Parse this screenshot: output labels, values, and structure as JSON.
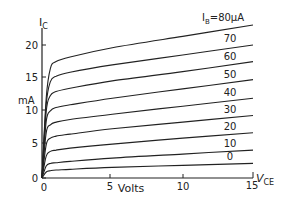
{
  "chart_data": {
    "type": "line",
    "title": "",
    "xlabel": "Volts",
    "xaxis_symbol": "V",
    "xaxis_symbol_sub": "CE",
    "ylabel": "mA",
    "yaxis_symbol": "I",
    "yaxis_symbol_sub": "C",
    "xlim": [
      0,
      15
    ],
    "ylim": [
      0,
      23
    ],
    "x_ticks": [
      "0",
      "5",
      "10",
      "15"
    ],
    "y_ticks": [
      "0",
      "5",
      "10",
      "15",
      "20"
    ],
    "grid": false,
    "legend_position": "inline-right",
    "series_param_label": "I",
    "series_param_sub": "B",
    "series_param_unit": "μA",
    "x": [
      0,
      0.3,
      0.6,
      1,
      2,
      5,
      10,
      15
    ],
    "series": [
      {
        "name": "80",
        "label": "I_B = 80μA",
        "values": [
          0,
          12.0,
          16.5,
          17.5,
          18.2,
          19.6,
          21.3,
          23.0
        ]
      },
      {
        "name": "70",
        "label": "70",
        "values": [
          0,
          11.0,
          14.5,
          15.3,
          15.9,
          17.0,
          18.5,
          20.0
        ]
      },
      {
        "name": "60",
        "label": "60",
        "values": [
          0,
          10.0,
          12.4,
          13.0,
          13.5,
          14.6,
          16.0,
          17.5
        ]
      },
      {
        "name": "50",
        "label": "50",
        "values": [
          0,
          8.5,
          10.1,
          10.6,
          11.0,
          12.0,
          13.4,
          14.8
        ]
      },
      {
        "name": "40",
        "label": "40",
        "values": [
          0,
          6.8,
          8.0,
          8.4,
          8.8,
          9.6,
          10.8,
          12.0
        ]
      },
      {
        "name": "30",
        "label": "30",
        "values": [
          0,
          5.0,
          6.0,
          6.3,
          6.6,
          7.4,
          8.4,
          9.4
        ]
      },
      {
        "name": "20",
        "label": "20",
        "values": [
          0,
          3.3,
          4.0,
          4.2,
          4.5,
          5.1,
          6.0,
          6.8
        ]
      },
      {
        "name": "10",
        "label": "10",
        "values": [
          0,
          1.8,
          2.2,
          2.3,
          2.5,
          3.0,
          3.6,
          4.2
        ]
      },
      {
        "name": "0",
        "label": "0",
        "values": [
          0,
          0.9,
          1.1,
          1.2,
          1.3,
          1.6,
          1.9,
          2.2
        ]
      }
    ]
  },
  "labels": {
    "y_symbol": "I",
    "y_sub": "C",
    "y_unit": "mA",
    "x_title": "Volts",
    "x_symbol": "V",
    "x_sub": "CE",
    "ib_prefix": "I",
    "ib_sub": "B",
    "ib_first": "=80μA",
    "curve_labels": [
      "70",
      "60",
      "50",
      "40",
      "30",
      "20",
      "10",
      "0"
    ],
    "x_ticks": [
      "0",
      "5",
      "10",
      "15"
    ],
    "y_ticks": [
      "0",
      "5",
      "10",
      "15",
      "20"
    ]
  }
}
